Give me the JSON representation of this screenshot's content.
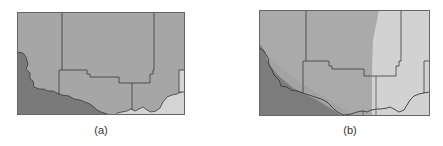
{
  "figure": {
    "panels": [
      {
        "id": "a",
        "caption": "(a)",
        "description": "Map region with county boundaries; dark region lower-left, medium gray main area, light region lower-right"
      },
      {
        "id": "b",
        "caption": "(b)",
        "description": "Same map region with a diagonal dark band lower-left, medium gray center, and a light vertical band on the right"
      }
    ],
    "colors": {
      "dark_region": "#7a7a7a",
      "medium_region": "#a6a6a6",
      "medium_region_b": "#ababab",
      "light_region": "#d4d4d4",
      "boundary_line": "#3a3a3a",
      "frame": "#666666"
    }
  }
}
